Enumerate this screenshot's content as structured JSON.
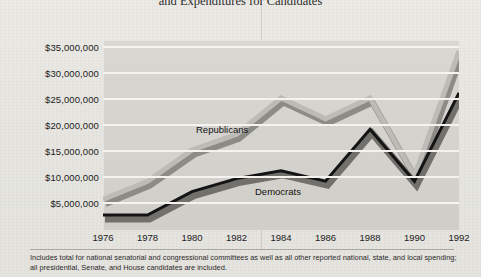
{
  "title": "and Expenditures for Candidates",
  "footnote": "Includes total for national senatorial and congressional committees as well as all other reported national, state, and local spending; all presidential, Senate, and House candidates are included.",
  "series_labels": {
    "republicans": "Republicans",
    "democrats": "Democrats"
  },
  "colors": {
    "republican_line": "#b9b7b2",
    "republican_shadow": "#8d8b86",
    "democrat_line": "#171717",
    "democrat_shadow": "#6e6c67",
    "plot_background": "#d5d3ce",
    "gridline": "#f4f3f0",
    "page_background": "#e8e6e1"
  },
  "chart_data": {
    "type": "line",
    "title": "and Expenditures for Candidates",
    "xlabel": "",
    "ylabel": "",
    "x": [
      1976,
      1978,
      1980,
      1982,
      1984,
      1986,
      1988,
      1990,
      1992
    ],
    "categories": [
      "1976",
      "1978",
      "1980",
      "1982",
      "1984",
      "1986",
      "1988",
      "1990",
      "1992"
    ],
    "ytick_labels": [
      "$5,000,000",
      "$10,000,000",
      "$15,000,000",
      "$20,000,000",
      "$25,000,000",
      "$30,000,000",
      "$35,000,000"
    ],
    "yticks": [
      5000000,
      10000000,
      15000000,
      20000000,
      25000000,
      30000000,
      35000000
    ],
    "ylim": [
      0,
      37000000
    ],
    "xlim": [
      1976,
      1992
    ],
    "grid": true,
    "legend_position": "inline-annotation",
    "series": [
      {
        "name": "Republicans",
        "color": "#b9b7b2",
        "values": [
          5500000,
          9000000,
          15000000,
          18000000,
          25000000,
          21000000,
          25000000,
          10000000,
          34000000
        ]
      },
      {
        "name": "Democrats",
        "color": "#171717",
        "values": [
          2500000,
          2500000,
          7000000,
          9500000,
          11000000,
          9000000,
          19000000,
          9000000,
          26000000
        ]
      }
    ],
    "annotations": [
      {
        "text": "Republicans",
        "x": 1984,
        "y": 19500000
      },
      {
        "text": "Democrats",
        "x": 1986,
        "y": 7000000
      }
    ]
  }
}
